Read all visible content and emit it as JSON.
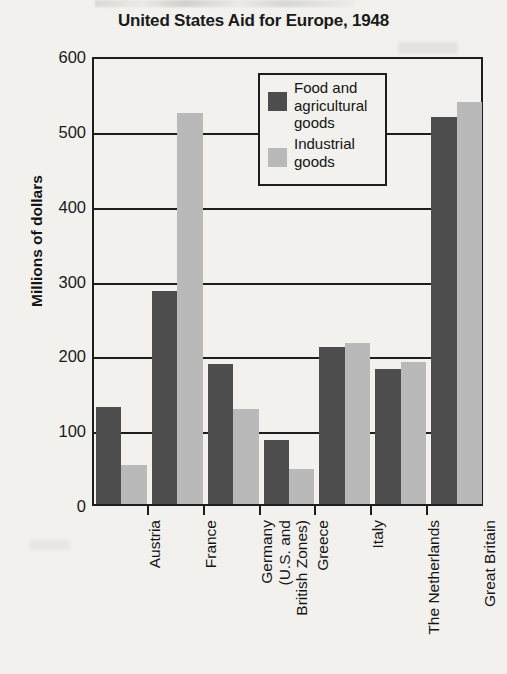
{
  "chart_data": {
    "type": "bar",
    "title": "United States Aid for Europe, 1948",
    "xlabel": "",
    "ylabel": "Millions of dollars",
    "ylim": [
      0,
      600
    ],
    "yticks": [
      0,
      100,
      200,
      300,
      400,
      500,
      600
    ],
    "ytick_labels": [
      "0",
      "100",
      "200",
      "300",
      "400",
      "500",
      "600"
    ],
    "grid": true,
    "legend_position": "upper center",
    "categories": [
      "Austria",
      "France",
      "Germany\n(U.S. and\nBritish Zones)",
      "Greece",
      "Italy",
      "The Netherlands",
      "Great Britain"
    ],
    "series": [
      {
        "name": "Food and\nagricultural\ngoods",
        "color": "#4d4d4d",
        "values": [
          130,
          285,
          187,
          85,
          210,
          180,
          517
        ]
      },
      {
        "name": "Industrial\ngoods",
        "color": "#b9b9b9",
        "values": [
          52,
          523,
          127,
          47,
          215,
          190,
          537
        ]
      }
    ]
  },
  "colors": {
    "background": "#f2f1ee",
    "axis": "#1d1d1d",
    "text": "#141414",
    "series_dark": "#4d4d4d",
    "series_light": "#b9b9b9"
  }
}
